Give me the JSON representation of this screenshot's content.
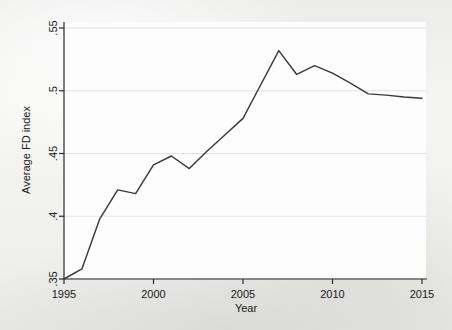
{
  "chart_data": {
    "type": "line",
    "title": "",
    "subtitle": "",
    "xlabel": "Year",
    "ylabel": "Average FD index",
    "xlim": [
      1995,
      2015
    ],
    "ylim": [
      0.35,
      0.55
    ],
    "xticks": [
      1995,
      2000,
      2005,
      2010,
      2015
    ],
    "xtick_labels": [
      "1995",
      "2000",
      "2005",
      "2010",
      "2015"
    ],
    "yticks": [
      0.35,
      0.4,
      0.45,
      0.5,
      0.55
    ],
    "ytick_labels": [
      ".35",
      ".4",
      ".45",
      ".5",
      ".55"
    ],
    "grid": "horizontal",
    "legend": "none",
    "line_color": "#3a3a3a",
    "background_color": "#fdfdfd",
    "page_color": "#f2f2f0",
    "x": [
      1995,
      1996,
      1997,
      1998,
      1999,
      2000,
      2001,
      2002,
      2003,
      2004,
      2005,
      2006,
      2007,
      2008,
      2009,
      2010,
      2011,
      2012,
      2013,
      2014,
      2015
    ],
    "series": [
      {
        "name": "Average FD index",
        "values": [
          0.35,
          0.358,
          0.398,
          0.421,
          0.418,
          0.441,
          0.448,
          0.438,
          0.452,
          0.465,
          0.478,
          0.505,
          0.532,
          0.513,
          0.52,
          0.514,
          0.506,
          0.4975,
          0.4965,
          0.495,
          0.494
        ]
      }
    ],
    "annotations": []
  },
  "axes": {
    "y_axis_name": "y-axis",
    "x_axis_name": "x-axis"
  }
}
